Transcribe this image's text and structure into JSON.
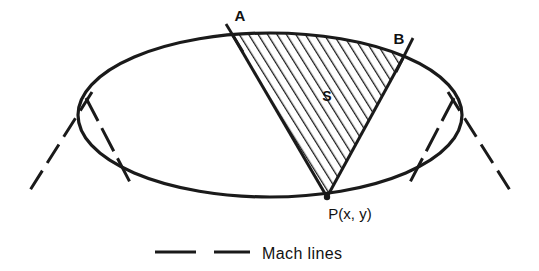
{
  "figure": {
    "type": "geometric-diagram",
    "background_color": "#ffffff",
    "ink_color": "#1a1a1a"
  },
  "labels": {
    "point_a": "A",
    "point_b": "B",
    "region_s": "S",
    "point_p": "P(x, y)"
  },
  "legend": {
    "text": "Mach lines",
    "line_style": "dashed"
  },
  "geometry": {
    "ellipse": {
      "cx": 270,
      "cy": 115,
      "rx": 192,
      "ry": 82
    },
    "point_p": {
      "x": 327,
      "y": 197
    },
    "point_a": {
      "x": 232,
      "y": 34
    },
    "point_b": {
      "x": 403,
      "y": 58
    }
  }
}
